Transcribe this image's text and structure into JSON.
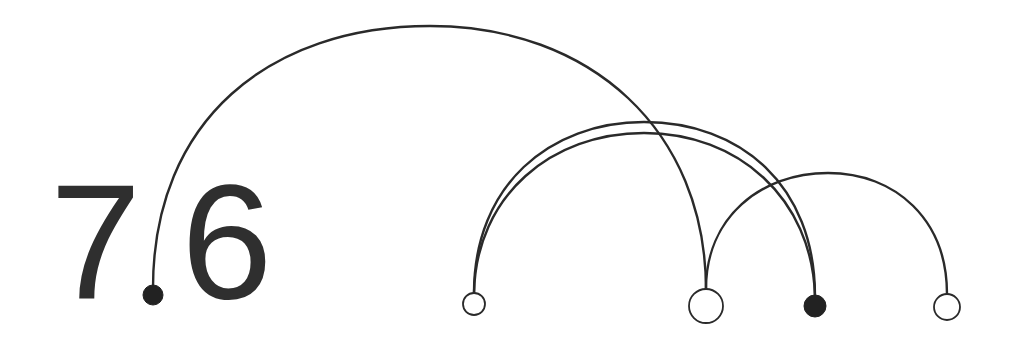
{
  "figure": {
    "section_number": {
      "major": "7",
      "minor": "6",
      "full": "7.6"
    },
    "colors": {
      "ink": "#2a2a2a",
      "text": "#2f2f2f",
      "background": "#ffffff",
      "filled_node": "#222222"
    },
    "nodes": [
      {
        "id": "n1",
        "x": 153,
        "y": 295,
        "r": 10,
        "style": "filled"
      },
      {
        "id": "n2",
        "x": 474,
        "y": 304,
        "r": 11,
        "style": "hollow"
      },
      {
        "id": "n3",
        "x": 706,
        "y": 306,
        "r": 17,
        "style": "hollow"
      },
      {
        "id": "n4",
        "x": 815,
        "y": 306,
        "r": 11,
        "style": "filled"
      },
      {
        "id": "n5",
        "x": 947,
        "y": 307,
        "r": 13,
        "style": "hollow"
      }
    ],
    "arcs": [
      {
        "from": "n1",
        "to": "n3",
        "apex_y": 26
      },
      {
        "from": "n2",
        "to": "n4",
        "apex_y": 122
      },
      {
        "from": "n2",
        "to": "n4",
        "apex_y": 133
      },
      {
        "from": "n3",
        "to": "n5",
        "apex_y": 173
      }
    ]
  }
}
